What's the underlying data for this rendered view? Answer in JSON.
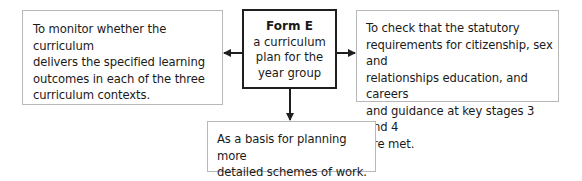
{
  "diagram": {
    "center": {
      "title": "Form E",
      "subtitle_lines": [
        "a curriculum",
        "plan for the",
        "year group"
      ]
    },
    "left": {
      "text_lines": [
        "To monitor whether the curriculum",
        "delivers the specified learning",
        "outcomes in each of the three",
        "curriculum contexts."
      ]
    },
    "right": {
      "text_lines": [
        "To check that the statutory",
        "requirements for citizenship, sex and",
        "relationships education, and careers",
        "and guidance at key stages 3 and 4",
        "are met."
      ]
    },
    "bottom": {
      "text_lines": [
        "As a basis for planning more",
        "detailed schemes of work."
      ]
    },
    "colors": {
      "thin_border": "#b8b8b8",
      "thick_border": "#1f1f1f",
      "arrow": "#1f1f1f",
      "text": "#1a1a1a"
    }
  }
}
